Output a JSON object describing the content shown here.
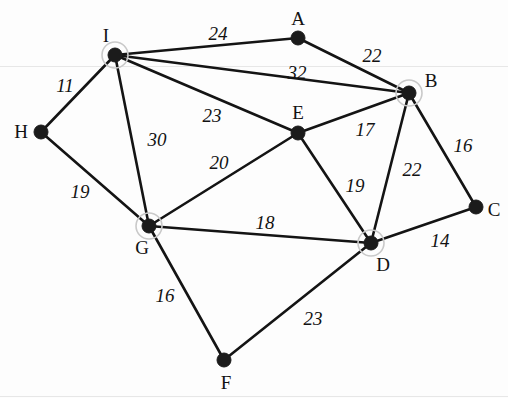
{
  "figure": {
    "kind": "undirected-weighted-graph",
    "background": "#fdfdfd",
    "edge_color": "#141414",
    "node_color": "#1b1b1b",
    "halo_color": "#c9c9c9",
    "width": 508,
    "height": 398
  },
  "nodes": [
    {
      "id": "A",
      "label": "A",
      "x": 298,
      "y": 38,
      "label_x": 298,
      "label_y": 18,
      "highlighted": false
    },
    {
      "id": "B",
      "label": "B",
      "x": 409,
      "y": 93,
      "label_x": 431,
      "label_y": 80,
      "highlighted": true
    },
    {
      "id": "C",
      "label": "C",
      "x": 476,
      "y": 207,
      "label_x": 494,
      "label_y": 209,
      "highlighted": false
    },
    {
      "id": "D",
      "label": "D",
      "x": 371,
      "y": 243,
      "label_x": 383,
      "label_y": 264,
      "highlighted": true
    },
    {
      "id": "E",
      "label": "E",
      "x": 298,
      "y": 133,
      "label_x": 298,
      "label_y": 112,
      "highlighted": false
    },
    {
      "id": "F",
      "label": "F",
      "x": 224,
      "y": 360,
      "label_x": 226,
      "label_y": 382,
      "highlighted": false
    },
    {
      "id": "G",
      "label": "G",
      "x": 149,
      "y": 226,
      "label_x": 142,
      "label_y": 247,
      "highlighted": true
    },
    {
      "id": "H",
      "label": "H",
      "x": 41,
      "y": 132,
      "label_x": 21,
      "label_y": 131,
      "highlighted": false
    },
    {
      "id": "I",
      "label": "I",
      "x": 115,
      "y": 55,
      "label_x": 106,
      "label_y": 35,
      "highlighted": true
    }
  ],
  "edges": [
    {
      "from": "I",
      "to": "A",
      "weight": "24",
      "label_x": 218,
      "label_y": 33
    },
    {
      "from": "A",
      "to": "B",
      "weight": "22",
      "label_x": 372,
      "label_y": 55
    },
    {
      "from": "I",
      "to": "B",
      "weight": "32",
      "label_x": 297,
      "label_y": 72
    },
    {
      "from": "I",
      "to": "H",
      "weight": "11",
      "label_x": 65,
      "label_y": 85
    },
    {
      "from": "I",
      "to": "E",
      "weight": "23",
      "label_x": 212,
      "label_y": 115
    },
    {
      "from": "I",
      "to": "G",
      "weight": "30",
      "label_x": 157,
      "label_y": 139
    },
    {
      "from": "H",
      "to": "G",
      "weight": "19",
      "label_x": 80,
      "label_y": 191
    },
    {
      "from": "G",
      "to": "E",
      "weight": "20",
      "label_x": 219,
      "label_y": 162
    },
    {
      "from": "E",
      "to": "B",
      "weight": "17",
      "label_x": 365,
      "label_y": 129
    },
    {
      "from": "B",
      "to": "C",
      "weight": "16",
      "label_x": 463,
      "label_y": 145
    },
    {
      "from": "B",
      "to": "D",
      "weight": "22",
      "label_x": 412,
      "label_y": 169
    },
    {
      "from": "E",
      "to": "D",
      "weight": "19",
      "label_x": 355,
      "label_y": 185
    },
    {
      "from": "G",
      "to": "D",
      "weight": "18",
      "label_x": 265,
      "label_y": 222
    },
    {
      "from": "D",
      "to": "C",
      "weight": "14",
      "label_x": 440,
      "label_y": 240
    },
    {
      "from": "G",
      "to": "F",
      "weight": "16",
      "label_x": 165,
      "label_y": 295
    },
    {
      "from": "F",
      "to": "D",
      "weight": "23",
      "label_x": 313,
      "label_y": 318
    }
  ]
}
